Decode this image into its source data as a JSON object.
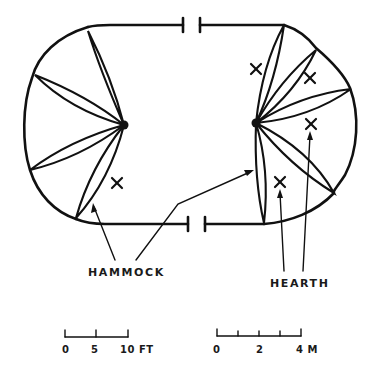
{
  "diagram": {
    "type": "floor-plan",
    "line_color": "#111111",
    "background": "#ffffff",
    "labels": {
      "hammock": "HAMMOCK",
      "hearth": "HEARTH"
    },
    "doors": [
      {
        "position": "top",
        "left_x": 183,
        "right_x": 200,
        "y": 25
      },
      {
        "position": "bottom",
        "left_x": 188,
        "right_x": 205,
        "y": 224
      }
    ],
    "hubs": [
      {
        "side": "left",
        "x": 124,
        "y": 125
      },
      {
        "side": "right",
        "x": 256,
        "y": 123
      }
    ],
    "hammocks": {
      "left": [
        [
          88,
          31
        ],
        [
          35,
          75
        ],
        [
          30,
          170
        ],
        [
          76,
          218
        ]
      ],
      "right": [
        [
          284,
          25
        ],
        [
          316,
          50
        ],
        [
          351,
          89
        ],
        [
          334,
          193
        ],
        [
          264,
          223
        ]
      ]
    },
    "hearths": [
      {
        "x": 117,
        "y": 183
      },
      {
        "x": 256,
        "y": 69
      },
      {
        "x": 310,
        "y": 78
      },
      {
        "x": 311,
        "y": 124
      },
      {
        "x": 280,
        "y": 182
      }
    ]
  },
  "scales": {
    "feet": {
      "unit": "FT",
      "ticks": [
        "0",
        "5",
        "10"
      ],
      "label_0": "0",
      "label_1": "5",
      "label_2": "10 FT"
    },
    "meters": {
      "unit": "M",
      "ticks": [
        "0",
        "2",
        "4"
      ],
      "label_0": "0",
      "label_1": "2",
      "label_2": "4 M"
    }
  }
}
